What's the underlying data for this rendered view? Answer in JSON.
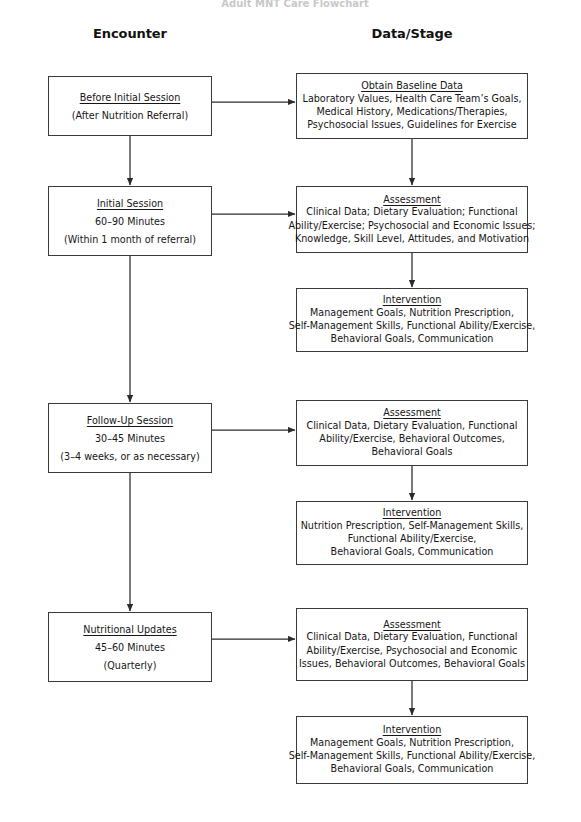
{
  "figure": {
    "title_partial": "Adult MNT Care Flowchart",
    "columns": [
      {
        "id": "encounter",
        "label": "Encounter"
      },
      {
        "id": "data_stage",
        "label": "Data/Stage"
      }
    ]
  },
  "encounters": [
    {
      "id": "before-initial-session",
      "title": "Before Initial Session",
      "lines": [
        "(After Nutrition Referral)"
      ]
    },
    {
      "id": "initial-session",
      "title": "Initial Session",
      "lines": [
        "60–90 Minutes",
        "(Within 1 month of referral)"
      ]
    },
    {
      "id": "follow-up-session",
      "title": "Follow-Up Session",
      "lines": [
        "30–45 Minutes",
        "(3–4 weeks, or as necessary)"
      ]
    },
    {
      "id": "nutritional-updates",
      "title": "Nutritional Updates",
      "lines": [
        "45–60 Minutes",
        "(Quarterly)"
      ]
    }
  ],
  "stages": [
    {
      "id": "obtain-baseline-data",
      "title": "Obtain Baseline Data",
      "lines": [
        "Laboratory Values, Health Care Team’s Goals,",
        "Medical History, Medications/Therapies,",
        "Psychosocial Issues, Guidelines for Exercise"
      ]
    },
    {
      "id": "assessment-initial",
      "title": "Assessment",
      "lines": [
        "Clinical Data; Dietary Evaluation; Functional",
        "Ability/Exercise; Psychosocial and Economic Issues;",
        "Knowledge, Skill Level, Attitudes, and Motivation"
      ]
    },
    {
      "id": "intervention-initial",
      "title": "Intervention",
      "lines": [
        "Management Goals, Nutrition Prescription,",
        "Self-Management Skills, Functional Ability/Exercise,",
        "Behavioral Goals, Communication"
      ]
    },
    {
      "id": "assessment-followup",
      "title": "Assessment",
      "lines": [
        "Clinical Data, Dietary Evaluation, Functional",
        "Ability/Exercise, Behavioral Outcomes,",
        "Behavioral Goals"
      ]
    },
    {
      "id": "intervention-followup",
      "title": "Intervention",
      "lines": [
        "Nutrition Prescription, Self-Management Skills,",
        "Functional Ability/Exercise,",
        "Behavioral Goals, Communication"
      ]
    },
    {
      "id": "assessment-updates",
      "title": "Assessment",
      "lines": [
        "Clinical Data, Dietary Evaluation, Functional",
        "Ability/Exercise, Psychosocial and Economic",
        "Issues, Behavioral Outcomes, Behavioral Goals"
      ]
    },
    {
      "id": "intervention-updates",
      "title": "Intervention",
      "lines": [
        "Management Goals, Nutrition Prescription,",
        "Self-Management Skills, Functional Ability/Exercise,",
        "Behavioral Goals, Communication"
      ]
    }
  ],
  "style": {
    "box_border": "#3a3a3a",
    "connector": "#2b2b2b",
    "text": "#151515",
    "background": "#ffffff"
  }
}
